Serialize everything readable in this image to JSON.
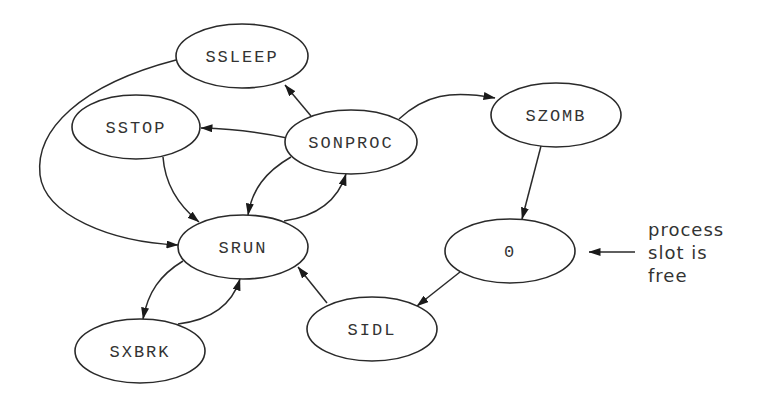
{
  "diagram": {
    "nodes": [
      {
        "id": "SSLEEP",
        "label": "SSLEEP",
        "cx": 242,
        "cy": 56,
        "rx": 66,
        "ry": 32
      },
      {
        "id": "SSTOP",
        "label": "SSTOP",
        "cx": 136,
        "cy": 127,
        "rx": 64,
        "ry": 32
      },
      {
        "id": "SONPROC",
        "label": "SONPROC",
        "cx": 351,
        "cy": 142,
        "rx": 66,
        "ry": 32
      },
      {
        "id": "SZOMB",
        "label": "SZOMB",
        "cx": 556,
        "cy": 115,
        "rx": 65,
        "ry": 32
      },
      {
        "id": "SRUN",
        "label": "SRUN",
        "cx": 243,
        "cy": 247,
        "rx": 65,
        "ry": 32
      },
      {
        "id": "ZERO",
        "label": "0",
        "cx": 510,
        "cy": 251,
        "rx": 65,
        "ry": 32
      },
      {
        "id": "SIDL",
        "label": "SIDL",
        "cx": 372,
        "cy": 329,
        "rx": 65,
        "ry": 32
      },
      {
        "id": "SXBRK",
        "label": "SXBRK",
        "cx": 140,
        "cy": 351,
        "rx": 65,
        "ry": 32
      }
    ],
    "edges": [
      {
        "from": "SONPROC",
        "to": "SSLEEP"
      },
      {
        "from": "SONPROC",
        "to": "SSTOP"
      },
      {
        "from": "SONPROC",
        "to": "SZOMB"
      },
      {
        "from": "SONPROC",
        "to": "SRUN"
      },
      {
        "from": "SRUN",
        "to": "SONPROC"
      },
      {
        "from": "SSLEEP",
        "to": "SRUN"
      },
      {
        "from": "SSTOP",
        "to": "SRUN"
      },
      {
        "from": "SRUN",
        "to": "SXBRK"
      },
      {
        "from": "SXBRK",
        "to": "SRUN"
      },
      {
        "from": "SIDL",
        "to": "SRUN"
      },
      {
        "from": "SZOMB",
        "to": "ZERO"
      },
      {
        "from": "ZERO",
        "to": "SIDL"
      }
    ],
    "annotation": {
      "lines": [
        "process",
        "slot is",
        "free"
      ],
      "points_to": "ZERO"
    }
  }
}
